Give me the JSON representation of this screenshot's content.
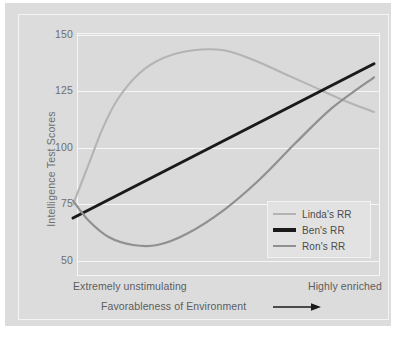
{
  "chart_data": {
    "type": "line",
    "title": "",
    "xlabel": "Favorableness of Environment",
    "ylabel": "Intelligence Test Scores",
    "ylim": [
      25,
      150
    ],
    "yticks": [
      150,
      125,
      100,
      75,
      50
    ],
    "ytick_labels": [
      "150",
      "125",
      "100",
      "75",
      "50"
    ],
    "xlim": [
      0,
      1
    ],
    "xtick_labels": [
      "Extremely unstimulating",
      "Highly enriched"
    ],
    "grid": true,
    "legend_position": "lower right",
    "series": [
      {
        "name": "Linda's RR",
        "color": "#b4b4b4",
        "points": [
          [
            0.0,
            60
          ],
          [
            0.05,
            80
          ],
          [
            0.1,
            100
          ],
          [
            0.15,
            115
          ],
          [
            0.22,
            128
          ],
          [
            0.3,
            136
          ],
          [
            0.4,
            140
          ],
          [
            0.5,
            140
          ],
          [
            0.6,
            135
          ],
          [
            0.7,
            128
          ],
          [
            0.8,
            121
          ],
          [
            0.9,
            114
          ],
          [
            1.0,
            108
          ]
        ]
      },
      {
        "name": "Ben's RR",
        "color": "#1a1a1a",
        "points": [
          [
            0.0,
            53
          ],
          [
            1.0,
            133
          ]
        ]
      },
      {
        "name": "Ron's RR",
        "color": "#909090",
        "points": [
          [
            0.0,
            62
          ],
          [
            0.05,
            52
          ],
          [
            0.12,
            43
          ],
          [
            0.2,
            39
          ],
          [
            0.28,
            39
          ],
          [
            0.38,
            45
          ],
          [
            0.5,
            57
          ],
          [
            0.62,
            73
          ],
          [
            0.74,
            92
          ],
          [
            0.86,
            110
          ],
          [
            1.0,
            126
          ]
        ]
      }
    ]
  },
  "axes": {
    "y_title": "Intelligence Test Scores",
    "y_ticks": [
      "150",
      "125",
      "100",
      "75",
      "50"
    ],
    "x_left_caption": "Extremely unstimulating",
    "x_right_caption": "Highly enriched",
    "x_title": "Favorableness of Environment"
  },
  "legend": {
    "entries": [
      {
        "label": "Linda's RR",
        "color": "#b4b4b4"
      },
      {
        "label": "Ben's RR",
        "color": "#1a1a1a"
      },
      {
        "label": "Ron's RR",
        "color": "#909090"
      }
    ]
  },
  "colors": {
    "panel_background": "#dcdcdc",
    "plot_background": "#dadada",
    "gridline": "#f6f6f6",
    "tick_text": "#6e6e6e",
    "caption_text": "#5d5d5d"
  }
}
